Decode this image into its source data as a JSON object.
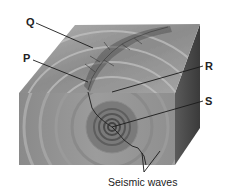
{
  "diagram": {
    "labels": {
      "Q": "Q",
      "P": "P",
      "R": "R",
      "S": "S",
      "seismic_waves": "Seismic waves"
    },
    "colors": {
      "background": "#ffffff",
      "front_face": "#8e8e8e",
      "top_face": "#9a9a9a",
      "side_face": "#4a4a4a",
      "leader_line": "#1a1a1a",
      "fault_line": "#2a2a2a",
      "text": "#222222"
    },
    "points": {
      "Q": {
        "pointer_to": [
          93,
          48
        ],
        "label_at": [
          30,
          22
        ]
      },
      "P": {
        "pointer_to": [
          88,
          82
        ],
        "label_at": [
          27,
          58
        ]
      },
      "R": {
        "pointer_to": [
          112,
          92
        ],
        "label_at": [
          207,
          66
        ]
      },
      "S": {
        "pointer_to": [
          112,
          127
        ],
        "label_at": [
          207,
          101
        ]
      },
      "seismic_waves": {
        "pointer_to": [
          [
            142,
            153
          ],
          [
            160,
            151
          ]
        ],
        "label_at": [
          108,
          183
        ]
      }
    }
  }
}
